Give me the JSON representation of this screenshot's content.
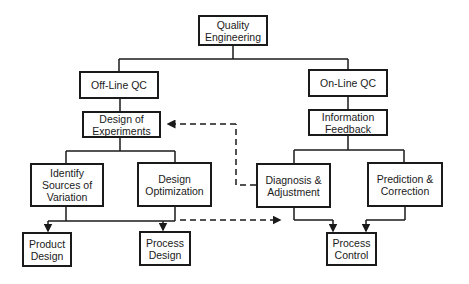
{
  "diagram": {
    "type": "hierarchy-flowchart",
    "nodes": {
      "quality_engineering": {
        "label": "Quality Engineering"
      },
      "offline_qc": {
        "label": "Off-Line QC"
      },
      "online_qc": {
        "label": "On-Line QC"
      },
      "design_of_experiments": {
        "label": "Design of Experiments"
      },
      "information_feedback": {
        "label": "Information Feedback"
      },
      "identify_sources": {
        "label": "Identify Sources of Variation"
      },
      "design_optimization": {
        "label": "Design Optimization"
      },
      "diagnosis_adjustment": {
        "label": "Diagnosis & Adjustment"
      },
      "prediction_correction": {
        "label": "Prediction & Correction"
      },
      "product_design": {
        "label": "Product Design"
      },
      "process_design": {
        "label": "Process Design"
      },
      "process_control": {
        "label": "Process Control"
      }
    },
    "edges": [
      {
        "from": "quality_engineering",
        "to": "offline_qc",
        "style": "solid"
      },
      {
        "from": "quality_engineering",
        "to": "online_qc",
        "style": "solid"
      },
      {
        "from": "offline_qc",
        "to": "design_of_experiments",
        "style": "solid"
      },
      {
        "from": "online_qc",
        "to": "information_feedback",
        "style": "solid"
      },
      {
        "from": "design_of_experiments",
        "to": "identify_sources",
        "style": "solid"
      },
      {
        "from": "design_of_experiments",
        "to": "design_optimization",
        "style": "solid"
      },
      {
        "from": "information_feedback",
        "to": "diagnosis_adjustment",
        "style": "solid"
      },
      {
        "from": "information_feedback",
        "to": "prediction_correction",
        "style": "solid"
      },
      {
        "from": "identify_sources",
        "to": "product_design",
        "style": "solid-arrow"
      },
      {
        "from": "design_optimization",
        "to": "process_design",
        "style": "solid-arrow"
      },
      {
        "from": "diagnosis_adjustment",
        "to": "process_control",
        "style": "solid-arrow"
      },
      {
        "from": "prediction_correction",
        "to": "process_control",
        "style": "solid-arrow"
      },
      {
        "from": "diagnosis_adjustment",
        "to": "design_of_experiments",
        "style": "dashed-arrow"
      },
      {
        "from": "design_optimization",
        "to": "process_control",
        "style": "dashed-arrow"
      }
    ],
    "colors": {
      "line": "#1a1a1a",
      "background": "#ffffff"
    }
  }
}
